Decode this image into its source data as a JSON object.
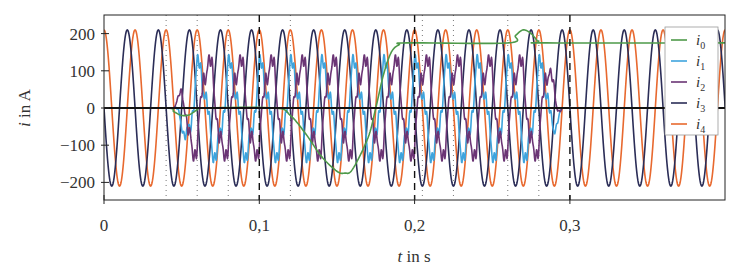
{
  "chart_data": {
    "type": "line",
    "title": "",
    "xlabel": "t in s",
    "ylabel": "i in A",
    "xlabel_parts": {
      "var": "t",
      "unit": " in s"
    },
    "ylabel_parts": {
      "var": "i",
      "unit": " in A"
    },
    "xlim": [
      0,
      0.4
    ],
    "ylim": [
      -250,
      250
    ],
    "xticks": [
      0,
      0.1,
      0.2,
      0.3
    ],
    "xtick_labels": [
      "0",
      "0,1",
      "0,2",
      "0,3"
    ],
    "yticks": [
      200,
      100,
      0,
      -100,
      -200
    ],
    "ytick_labels": [
      "200",
      "100",
      "0",
      "−100",
      "−200"
    ],
    "grid": false,
    "legend_position": "upper right",
    "dashed_vlines": [
      0.1,
      0.2,
      0.3
    ],
    "dotted_vlines": [
      0.04,
      0.06,
      0.08,
      0.12,
      0.205,
      0.225,
      0.26,
      0.28
    ],
    "series": [
      {
        "name": "i0",
        "label_var": "i",
        "label_sub": "0",
        "color": "#4e9a4a",
        "description": "zero-sequence/DC: 0, small dip ~-20 at t~0.05, dips to ~-175 at t~0.155, rises to ~175 by t~0.19, bump to ~210 at t~0.27, then 175",
        "points": [
          [
            0,
            0
          ],
          [
            0.04,
            0
          ],
          [
            0.045,
            -10
          ],
          [
            0.05,
            -20
          ],
          [
            0.055,
            -18
          ],
          [
            0.06,
            -5
          ],
          [
            0.065,
            0
          ],
          [
            0.11,
            0
          ],
          [
            0.12,
            -20
          ],
          [
            0.13,
            -70
          ],
          [
            0.14,
            -130
          ],
          [
            0.15,
            -170
          ],
          [
            0.155,
            -175
          ],
          [
            0.16,
            -165
          ],
          [
            0.17,
            -80
          ],
          [
            0.175,
            0
          ],
          [
            0.18,
            90
          ],
          [
            0.185,
            150
          ],
          [
            0.19,
            170
          ],
          [
            0.195,
            175
          ],
          [
            0.26,
            175
          ],
          [
            0.265,
            195
          ],
          [
            0.27,
            210
          ],
          [
            0.275,
            200
          ],
          [
            0.28,
            178
          ],
          [
            0.285,
            175
          ],
          [
            0.4,
            175
          ]
        ]
      },
      {
        "name": "i1",
        "label_var": "i",
        "label_sub": "1",
        "color": "#3ea4dd",
        "description": "distorted 50 Hz, active ~0.045-0.30, amplitude ~110 with negative peaks ~-140",
        "t_start": 0.045,
        "t_end": 0.295,
        "amplitude": 115,
        "freq_hz": 50,
        "phase_deg": 60,
        "harmonic3": 0.25,
        "offset": -15
      },
      {
        "name": "i2",
        "label_var": "i",
        "label_sub": "2",
        "color": "#6b3575",
        "description": "distorted 50 Hz, active ~0.045-0.30, amplitude ~130",
        "t_start": 0.045,
        "t_end": 0.295,
        "amplitude": 125,
        "freq_hz": 50,
        "phase_deg": -40,
        "harmonic3": 0.2,
        "offset": 0
      },
      {
        "name": "i3",
        "label_var": "i",
        "label_sub": "3",
        "color": "#2b2d57",
        "description": "50 Hz sinusoid, amplitude ~210, full range",
        "amplitude": 210,
        "freq_hz": 50,
        "phase_deg": 180,
        "type": "sine"
      },
      {
        "name": "i4",
        "label_var": "i",
        "label_sub": "4",
        "color": "#e8692f",
        "description": "50 Hz sinusoid, amplitude ~210, full range",
        "amplitude": 210,
        "freq_hz": 50,
        "phase_deg": 90,
        "type": "sine"
      }
    ]
  },
  "legend": {
    "items": [
      {
        "var": "i",
        "sub": "0"
      },
      {
        "var": "i",
        "sub": "1"
      },
      {
        "var": "i",
        "sub": "2"
      },
      {
        "var": "i",
        "sub": "3"
      },
      {
        "var": "i",
        "sub": "4"
      }
    ]
  }
}
